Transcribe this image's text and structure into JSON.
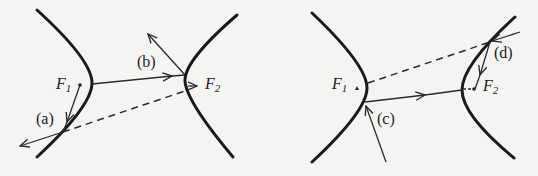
{
  "diagrams": [
    {
      "id": "left",
      "foci": [
        {
          "label": "F",
          "sub": "1"
        },
        {
          "label": "F",
          "sub": "2"
        }
      ],
      "cases": [
        {
          "label": "(a)"
        },
        {
          "label": "(b)"
        }
      ]
    },
    {
      "id": "right",
      "foci": [
        {
          "label": "F",
          "sub": "1"
        },
        {
          "label": "F",
          "sub": "2"
        }
      ],
      "cases": [
        {
          "label": "(c)"
        },
        {
          "label": "(d)"
        }
      ]
    }
  ],
  "colors": {
    "stroke": "#1a1a1a",
    "background": "#f4f4f2"
  }
}
